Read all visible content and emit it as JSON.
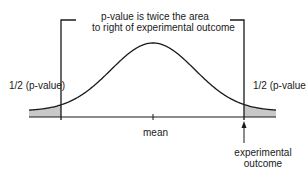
{
  "diagram": {
    "title_line1": "p-value is twice the area",
    "title_line2": "to right of experimental outcome",
    "left_tail_label": "1/2 (p-value)",
    "right_tail_label": "1/2 (p-value)",
    "center_label": "mean",
    "outcome_label_line1": "experimental",
    "outcome_label_line2": "outcome",
    "colors": {
      "line": "#1a1a1a",
      "shade": "#c8c8c8",
      "background": "#ffffff"
    }
  }
}
